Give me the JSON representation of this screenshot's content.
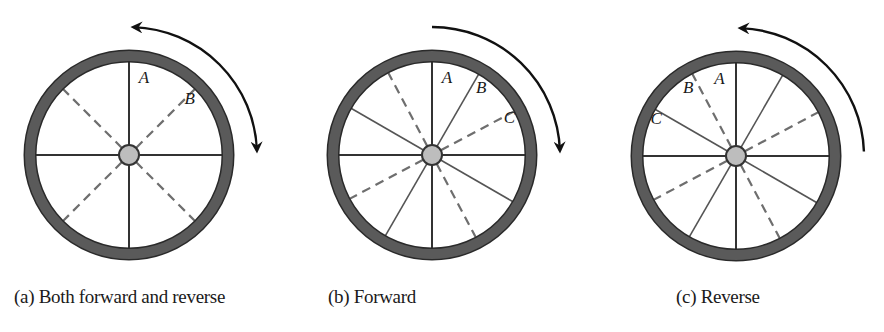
{
  "figure": {
    "colors": {
      "rim": "#5a5a5a",
      "rim_edge": "#2a2a2a",
      "spoke_solid": "#333333",
      "spoke_dashed": "#6e6e6e",
      "hub_fill": "#bdbdbd",
      "hub_stroke": "#333333",
      "arrow": "#111111"
    },
    "panels": [
      {
        "id": "a",
        "caption": "(a) Both forward and reverse",
        "center": [
          129,
          155
        ],
        "rim_radius": 99,
        "rim_width": 11,
        "hub_radius": 10,
        "spoke_length": 94,
        "solid_spoke_angles_deg": [
          0,
          90,
          180,
          270
        ],
        "dashed_spoke_angles_deg": [
          45,
          135,
          225,
          315
        ],
        "labels": [
          {
            "text": "A",
            "angle_deg": 5,
            "r": 78,
            "dx": 8
          },
          {
            "text": "B",
            "angle_deg": 45,
            "r": 80,
            "dx": 4
          }
        ],
        "arrow": {
          "type": "double",
          "from_deg": 2,
          "to_deg": 88,
          "radius": 128
        }
      },
      {
        "id": "b",
        "caption": "(b) Forward",
        "center": [
          432,
          155
        ],
        "rim_radius": 99,
        "rim_width": 11,
        "hub_radius": 10,
        "spoke_length": 94,
        "solid_spoke_angles_deg": [
          0,
          30,
          90,
          120,
          180,
          210,
          270,
          300
        ],
        "dashed_spoke_angles_deg": [
          62,
          152,
          242,
          332
        ],
        "labels": [
          {
            "text": "A",
            "angle_deg": 5,
            "r": 78,
            "dx": 8
          },
          {
            "text": "B",
            "angle_deg": 30,
            "r": 78,
            "dx": 10
          },
          {
            "text": "C",
            "angle_deg": 62,
            "r": 80,
            "dx": 6
          }
        ],
        "arrow": {
          "type": "cw",
          "from_deg": 0,
          "to_deg": 88,
          "radius": 128
        }
      },
      {
        "id": "c",
        "caption": "(c) Reverse",
        "center": [
          736,
          156
        ],
        "rim_radius": 99,
        "rim_width": 11,
        "hub_radius": 10,
        "spoke_length": 94,
        "solid_spoke_angles_deg": [
          0,
          30,
          90,
          120,
          180,
          210,
          270,
          300
        ],
        "dashed_spoke_angles_deg": [
          -28,
          62,
          152,
          242
        ],
        "labels": [
          {
            "text": "A",
            "angle_deg": -5,
            "r": 78,
            "dx": -10
          },
          {
            "text": "B",
            "angle_deg": -30,
            "r": 80,
            "dx": -8
          },
          {
            "text": "C",
            "angle_deg": -62,
            "r": 82,
            "dx": -8
          }
        ],
        "arrow": {
          "type": "ccw",
          "from_deg": 88,
          "to_deg": 2,
          "radius": 128
        }
      }
    ]
  }
}
